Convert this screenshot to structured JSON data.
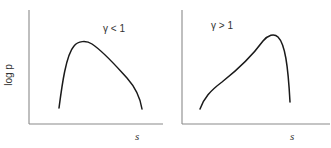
{
  "figure": {
    "y_label": "log p",
    "panels": [
      {
        "id": "left",
        "condition_label": "γ < 1",
        "x_label": "s",
        "curve_description": "sharp rise to early peak, then gradual decline, then steep drop"
      },
      {
        "id": "right",
        "condition_label": "γ > 1",
        "x_label": "s",
        "curve_description": "gradual roughly linear rise to late peak, then steep drop"
      }
    ],
    "colors": {
      "axis": "#8a8a8a",
      "curve": "#1a1a1a",
      "text": "#333333",
      "background": "#ffffff"
    }
  }
}
